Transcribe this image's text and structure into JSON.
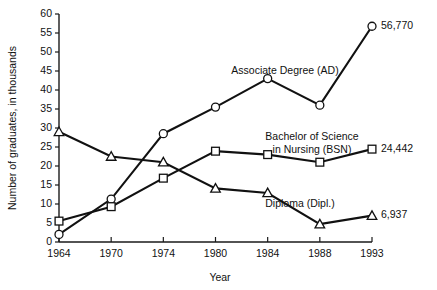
{
  "chart_data": {
    "type": "line",
    "title": "",
    "xlabel": "Year",
    "ylabel": "Number of graduates, in thousands",
    "categories": [
      "1964",
      "1970",
      "1974",
      "1980",
      "1984",
      "1988",
      "1993"
    ],
    "ylim": [
      0,
      60
    ],
    "ytick_step": 5,
    "yticks": [
      "0",
      "5",
      "10",
      "15",
      "20",
      "25",
      "30",
      "35",
      "40",
      "45",
      "50",
      "55",
      "60"
    ],
    "grid": false,
    "legend": "inline-labels",
    "series": [
      {
        "name": "Associate Degree (AD)",
        "marker": "circle",
        "label_text": "Associate Degree (AD)",
        "end_value_label": "56,770",
        "values": [
          2.0,
          11.3,
          28.5,
          35.5,
          43.0,
          36.0,
          56.77
        ]
      },
      {
        "name": "Bachelor of Science in Nursing (BSN)",
        "marker": "square",
        "label_text": "Bachelor of Science in Nursing (BSN)",
        "label_line1": "Bachelor of Science",
        "label_line2": "in Nursing (BSN)",
        "end_value_label": "24,442",
        "values": [
          5.5,
          9.3,
          16.8,
          23.9,
          23.0,
          21.0,
          24.442
        ]
      },
      {
        "name": "Diploma (Dipl.)",
        "marker": "triangle",
        "label_text": "Diploma (Dipl.)",
        "end_value_label": "6,937",
        "values": [
          29.0,
          22.5,
          21.0,
          14.1,
          12.9,
          4.7,
          6.937
        ]
      }
    ]
  },
  "colors": {
    "ink": "#111111",
    "background": "#ffffff",
    "marker_fill": "#ffffff"
  }
}
